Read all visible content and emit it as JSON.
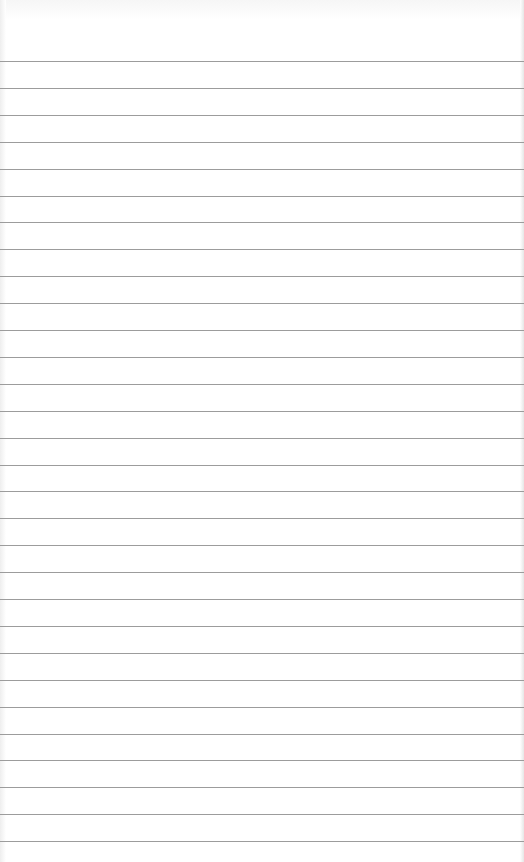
{
  "page": {
    "type": "blank lined paper",
    "background_color": "#ffffff",
    "rule_color": "#9c9c9c",
    "rule_count": 30,
    "first_rule_y": 61,
    "rule_spacing": 26.9
  }
}
